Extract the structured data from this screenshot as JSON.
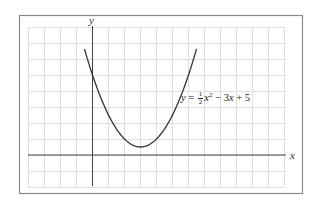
{
  "figure": {
    "equation": {
      "lhs": "y",
      "equals": "=",
      "coef_num": "1",
      "coef_den": "2",
      "var": "x",
      "exp": "2",
      "rest": " − 3",
      "rest_var": "x",
      "tail": " + 5"
    },
    "x_axis_label": "x",
    "y_axis_label": "y"
  },
  "chart_data": {
    "type": "line",
    "title": "",
    "function": "y = (1/2)x^2 - 3x + 5",
    "xlabel": "x",
    "ylabel": "y",
    "grid": true,
    "axis_ticks_labeled": false,
    "grid_unit": 1,
    "xlim": [
      -4,
      12
    ],
    "ylim": [
      -2,
      8
    ],
    "series": [
      {
        "name": "y = 1/2 x^2 - 3x + 5",
        "x": [
          -0.5,
          0,
          0.5,
          1,
          1.5,
          2,
          2.5,
          3,
          3.5,
          4,
          4.5,
          5,
          5.5,
          6,
          6.5
        ],
        "y": [
          6.625,
          5,
          3.625,
          2.5,
          1.625,
          1,
          0.625,
          0.5,
          0.625,
          1,
          1.625,
          2.5,
          3.625,
          5,
          6.625
        ]
      }
    ],
    "annotations": [
      {
        "text": "y = ½x² − 3x + 5",
        "position": "right of curve, near y≈4"
      }
    ],
    "vertex": [
      3,
      0.5
    ],
    "y_intercept": 5,
    "colors": {
      "curve": "#333333",
      "grid": "#dcdcdc",
      "axes": "#444444",
      "frame": "#888888"
    }
  }
}
